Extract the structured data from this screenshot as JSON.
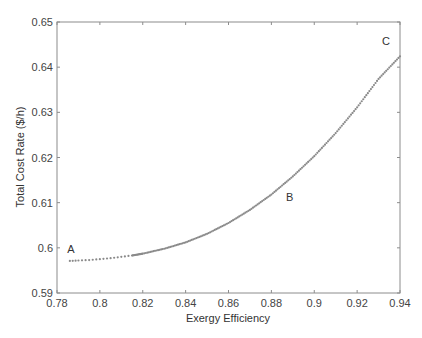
{
  "chart_data": {
    "type": "scatter",
    "title": "",
    "xlabel": "Exergy Efficiency",
    "ylabel": "Total Cost Rate ($/h)",
    "xlim": [
      0.78,
      0.94
    ],
    "ylim": [
      0.59,
      0.65
    ],
    "xticks": [
      0.78,
      0.8,
      0.82,
      0.84,
      0.86,
      0.88,
      0.9,
      0.92,
      0.94
    ],
    "xtick_labels": [
      "0.78",
      "0.8",
      "0.82",
      "0.84",
      "0.86",
      "0.88",
      "0.9",
      "0.92",
      "0.94"
    ],
    "yticks": [
      0.59,
      0.6,
      0.61,
      0.62,
      0.63,
      0.64,
      0.65
    ],
    "ytick_labels": [
      "0.59",
      "0.6",
      "0.61",
      "0.62",
      "0.63",
      "0.64",
      "0.65"
    ],
    "grid": false,
    "legend": null,
    "series": [
      {
        "name": "Pareto front",
        "color": "#8a8a8a",
        "x": [
          0.786,
          0.79,
          0.795,
          0.8,
          0.805,
          0.81,
          0.815,
          0.82,
          0.83,
          0.84,
          0.85,
          0.86,
          0.87,
          0.88,
          0.89,
          0.9,
          0.91,
          0.92,
          0.93,
          0.94
        ],
        "y": [
          0.5971,
          0.5972,
          0.5973,
          0.5975,
          0.5977,
          0.598,
          0.5983,
          0.5987,
          0.5998,
          0.6012,
          0.6031,
          0.6055,
          0.6084,
          0.6118,
          0.6158,
          0.6203,
          0.6254,
          0.6311,
          0.6374,
          0.6424
        ]
      }
    ],
    "annotations": [
      {
        "text": "A",
        "x": 0.7865,
        "y": 0.5988
      },
      {
        "text": "B",
        "x": 0.8885,
        "y": 0.6103
      },
      {
        "text": "C",
        "x": 0.9335,
        "y": 0.6449
      }
    ]
  }
}
